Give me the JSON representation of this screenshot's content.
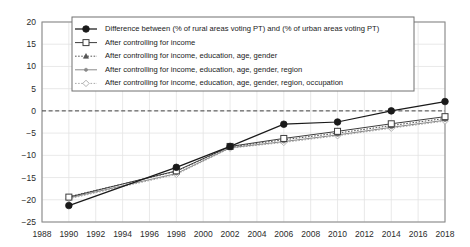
{
  "chart_data": {
    "type": "line",
    "title": "",
    "subtitle": "",
    "xlabel": "",
    "ylabel": "",
    "xlim": [
      1988,
      2018
    ],
    "ylim": [
      -25,
      20
    ],
    "ytick_step": 5,
    "xtick_step": 2,
    "grid": true,
    "zero_line": true,
    "legend_position": "upper-center",
    "x": [
      1990,
      1998,
      2002,
      2006,
      2010,
      2014,
      2018
    ],
    "xticks": [
      1988,
      1990,
      1992,
      1994,
      1996,
      1998,
      2000,
      2002,
      2004,
      2006,
      2008,
      2010,
      2012,
      2014,
      2016,
      2018
    ],
    "yticks": [
      20,
      15,
      10,
      5,
      0,
      -5,
      -10,
      -15,
      -20,
      -25
    ],
    "ytick_labels": [
      "20",
      "15",
      "10",
      "5",
      "0",
      "−5",
      "−10",
      "−15",
      "−20",
      "−25"
    ],
    "xtick_labels": [
      "1988",
      "1990",
      "1992",
      "1994",
      "1996",
      "1998",
      "2000",
      "2002",
      "2004",
      "2006",
      "2008",
      "2010",
      "2012",
      "2014",
      "2016",
      "2018"
    ],
    "series": [
      {
        "name": "Difference between (% of rural areas voting PT) and (% of urban areas voting PT)",
        "marker": "filled-circle",
        "line_style": "solid",
        "color": "#1a1a1a",
        "values": [
          -21.3,
          -12.7,
          -8.0,
          -3.0,
          -2.5,
          0.0,
          2.1
        ]
      },
      {
        "name": "After controlling for income",
        "marker": "open-square",
        "line_style": "solid",
        "color": "#3d3d3d",
        "values": [
          -19.4,
          -13.5,
          -8.0,
          -6.2,
          -4.6,
          -2.9,
          -1.3
        ]
      },
      {
        "name": "After controlling for income, education, age, gender",
        "marker": "small-triangle",
        "line_style": "dotted",
        "color": "#555555",
        "values": [
          -19.3,
          -13.6,
          -8.1,
          -6.5,
          -5.0,
          -3.3,
          -1.7
        ]
      },
      {
        "name": "After controlling for income, education, age, gender, region",
        "marker": "small-dot",
        "line_style": "solid",
        "color": "#8a8a8a",
        "values": [
          -19.6,
          -14.1,
          -8.3,
          -6.9,
          -5.4,
          -3.7,
          -2.1
        ]
      },
      {
        "name": "After controlling for income, education, age, gender, region, occupation",
        "marker": "open-diamond",
        "line_style": "dotted",
        "color": "#a8a8a8",
        "values": [
          -19.8,
          -14.3,
          -8.4,
          -7.1,
          -5.6,
          -3.9,
          -2.3
        ]
      }
    ]
  },
  "style": {
    "axis_color": "#8c8c8c",
    "grid_color": "#e3e3e3",
    "zero_line_color": "#404040",
    "legend_border_color": "#707070",
    "legend_background": "#ffffff",
    "background": "#ffffff"
  }
}
